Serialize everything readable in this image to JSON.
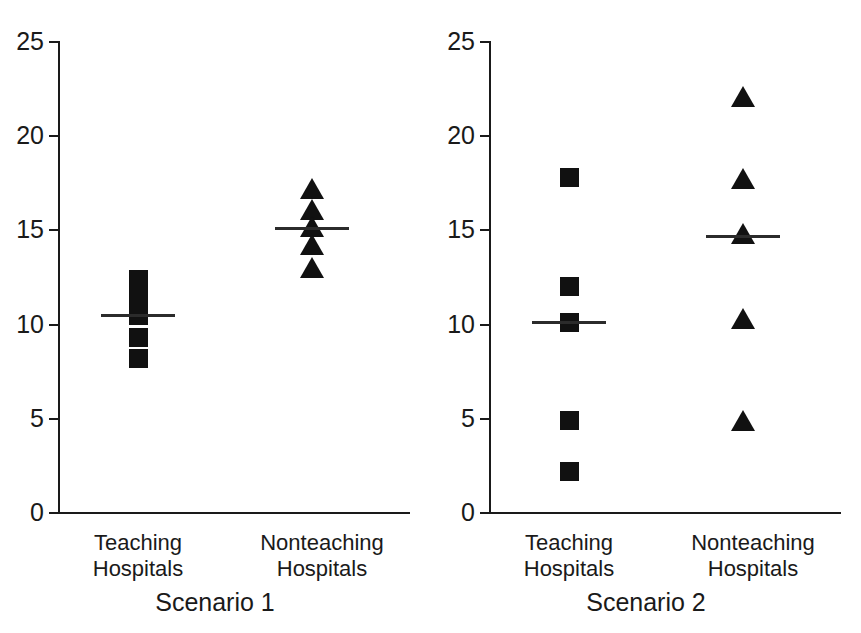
{
  "chart_data": [
    {
      "type": "scatter",
      "title": "Scenario 1",
      "xlabel": "",
      "ylabel": "",
      "ylim": [
        0,
        25
      ],
      "yticks": [
        0,
        5,
        10,
        15,
        20,
        25
      ],
      "grid": false,
      "legend": "none",
      "categories": [
        "Teaching Hospitals",
        "Nonteaching Hospitals"
      ],
      "series": [
        {
          "name": "Teaching Hospitals",
          "marker": "square",
          "values": [
            12.4,
            11.4,
            10.5,
            9.3,
            8.2
          ],
          "mean": 10.5
        },
        {
          "name": "Nonteaching Hospitals",
          "marker": "triangle",
          "values": [
            17.1,
            16.0,
            15.1,
            14.1,
            12.9
          ],
          "mean": 15.1
        }
      ]
    },
    {
      "type": "scatter",
      "title": "Scenario 2",
      "xlabel": "",
      "ylabel": "",
      "ylim": [
        0,
        25
      ],
      "yticks": [
        0,
        5,
        10,
        15,
        20,
        25
      ],
      "grid": false,
      "legend": "none",
      "categories": [
        "Teaching Hospitals",
        "Nonteaching Hospitals"
      ],
      "series": [
        {
          "name": "Teaching Hospitals",
          "marker": "square",
          "values": [
            17.8,
            12.0,
            10.1,
            4.9,
            2.2
          ],
          "mean": 10.1
        },
        {
          "name": "Nonteaching Hospitals",
          "marker": "triangle",
          "values": [
            22.0,
            17.6,
            14.7,
            10.2,
            4.8
          ],
          "mean": 14.7
        }
      ]
    }
  ],
  "panels": [
    {
      "scenario_label": "Scenario 1",
      "tick_labels": [
        "25",
        "20",
        "15",
        "10",
        "5",
        "0"
      ],
      "group_labels": [
        {
          "line1": "Teaching",
          "line2": "Hospitals"
        },
        {
          "line1": "Nonteaching",
          "line2": "Hospitals"
        }
      ]
    },
    {
      "scenario_label": "Scenario 2",
      "tick_labels": [
        "25",
        "20",
        "15",
        "10",
        "5",
        "0"
      ],
      "group_labels": [
        {
          "line1": "Teaching",
          "line2": "Hospitals"
        },
        {
          "line1": "Nonteaching",
          "line2": "Hospitals"
        }
      ]
    }
  ],
  "style": {
    "marker_color": "#111111",
    "axis_color": "#1a1a1a",
    "background": "#ffffff"
  }
}
